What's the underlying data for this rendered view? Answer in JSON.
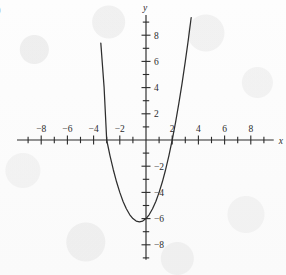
{
  "figure": {
    "corner_mark": ")",
    "x_axis_name": "x",
    "y_axis_name": "y"
  },
  "chart_data": {
    "type": "line",
    "title": "",
    "xlabel": "x",
    "ylabel": "y",
    "grid": false,
    "legend": false,
    "xlim": [
      -9,
      9
    ],
    "ylim": [
      -9,
      9
    ],
    "x_major_ticks": [
      -8,
      -6,
      -4,
      -2,
      2,
      4,
      6,
      8
    ],
    "x_major_tick_labels": [
      "-8",
      "-6",
      "-4",
      "-2",
      "2",
      "4",
      "6",
      "8"
    ],
    "x_minor_ticks": [
      -9,
      -7,
      -5,
      -3,
      -1,
      1,
      3,
      5,
      7,
      9
    ],
    "y_major_ticks": [
      8,
      6,
      4,
      2,
      -2,
      -4,
      -6,
      -8
    ],
    "y_major_tick_labels": [
      "8",
      "6",
      "4",
      "2",
      "-2",
      "-4",
      "-6",
      "-8"
    ],
    "y_minor_ticks": [
      9,
      7,
      5,
      3,
      1,
      -1,
      -3,
      -5,
      -7,
      -9
    ],
    "series": [
      {
        "name": "parabola",
        "equation": "y = x^2 + x - 6",
        "color": "#2e2e2e",
        "vertex": [
          -0.5,
          -6.25
        ],
        "roots": [
          -3,
          2
        ],
        "y_intercept": -6,
        "x": [
          -3.45,
          -3.2,
          -3.0,
          -2.75,
          -2.5,
          -2.25,
          -2.0,
          -1.75,
          -1.5,
          -1.25,
          -1.0,
          -0.75,
          -0.5,
          -0.25,
          0.0,
          0.25,
          0.5,
          0.75,
          1.0,
          1.25,
          1.5,
          1.75,
          2.0,
          2.25,
          2.5,
          2.75,
          3.0,
          3.2,
          3.45
        ],
        "y": [
          7.4,
          4.04,
          0.0,
          -1.19,
          -2.25,
          -3.19,
          -4.0,
          -4.69,
          -5.25,
          -5.69,
          -6.0,
          -6.19,
          -6.25,
          -6.19,
          -6.0,
          -5.69,
          -5.25,
          -4.69,
          -4.0,
          -3.19,
          -2.25,
          -1.19,
          0.0,
          1.31,
          2.75,
          4.31,
          6.0,
          7.44,
          9.35
        ]
      }
    ]
  }
}
